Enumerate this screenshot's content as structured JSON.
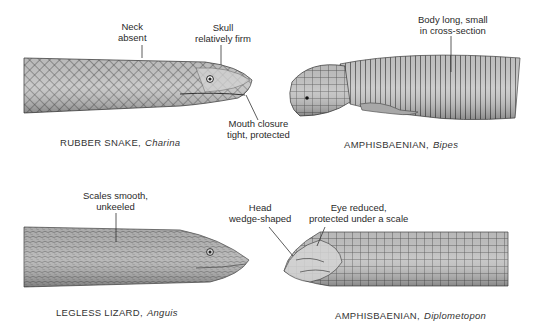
{
  "figure": {
    "panels": [
      {
        "id": "rubber-snake",
        "common_name": "RUBBER SNAKE,",
        "genus": "Charina",
        "annotations": [
          {
            "line1": "Neck",
            "line2": "absent"
          },
          {
            "line1": "Skull",
            "line2": "relatively firm"
          },
          {
            "line1": "Mouth closure",
            "line2": "tight, protected"
          }
        ]
      },
      {
        "id": "amphisbaenian-bipes",
        "common_name": "AMPHISBAENIAN,",
        "genus": "Bipes",
        "annotations": [
          {
            "line1": "Body long, small",
            "line2": "in cross-section"
          }
        ]
      },
      {
        "id": "legless-lizard",
        "common_name": "LEGLESS LIZARD,",
        "genus": "Anguis",
        "annotations": [
          {
            "line1": "Scales smooth,",
            "line2": "unkeeled"
          }
        ]
      },
      {
        "id": "amphisbaenian-diplometopon",
        "common_name": "AMPHISBAENIAN,",
        "genus": "Diplometopon",
        "annotations": [
          {
            "line1": "Head",
            "line2": "wedge-shaped"
          },
          {
            "line1": "Eye reduced,",
            "line2": "protected under a scale"
          }
        ]
      }
    ],
    "colors": {
      "body_fill": "#b9b9b9",
      "body_dark": "#6e6e6e",
      "scale_line": "#4a4a4a",
      "leader_line": "#333333"
    }
  }
}
